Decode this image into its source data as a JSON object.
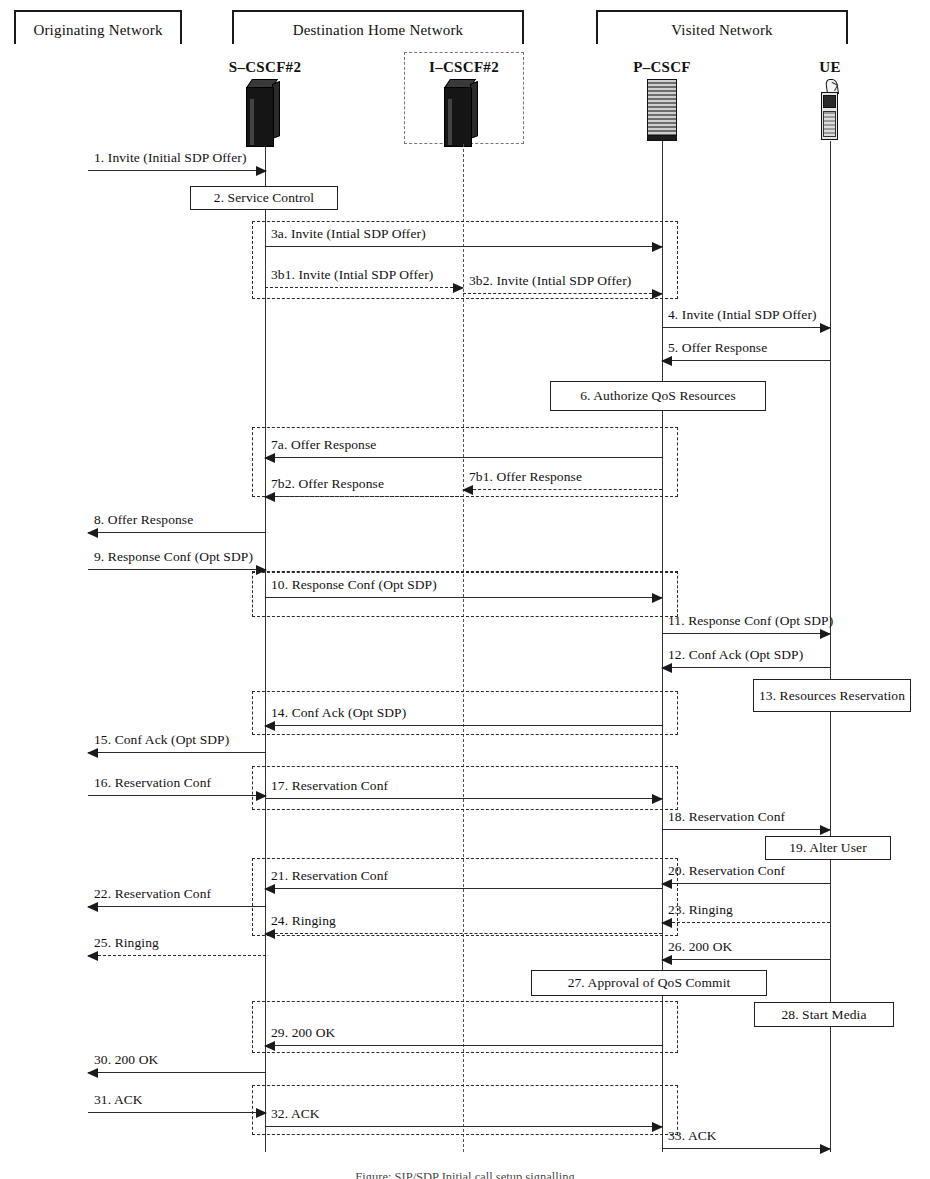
{
  "diagram": {
    "caption": "Figure: SIP/SDP Initial call setup signalling",
    "networks": [
      {
        "id": "originating",
        "label": "Originating Network"
      },
      {
        "id": "destination-home",
        "label": "Destination Home Network"
      },
      {
        "id": "visited",
        "label": "Visited Network"
      }
    ],
    "actors": [
      {
        "id": "s-cscf2",
        "label": "S–CSCF#2",
        "icon": "server-tower-icon",
        "optional": false
      },
      {
        "id": "i-cscf2",
        "label": "I–CSCF#2",
        "icon": "server-tower-icon",
        "optional": true
      },
      {
        "id": "p-cscf",
        "label": "P–CSCF",
        "icon": "server-rack-icon",
        "optional": false
      },
      {
        "id": "ue",
        "label": "UE",
        "icon": "mobile-phone-icon",
        "optional": false
      }
    ],
    "messages": [
      {
        "n": "1",
        "label": "1. Invite (Initial SDP Offer)",
        "from": "originating",
        "to": "s-cscf2",
        "dir": "right",
        "style": "solid"
      },
      {
        "n": "3a",
        "label": "3a. Invite (Intial SDP Offer)",
        "from": "s-cscf2",
        "to": "p-cscf",
        "dir": "right",
        "style": "solid"
      },
      {
        "n": "3b1",
        "label": "3b1. Invite (Intial SDP Offer)",
        "from": "s-cscf2",
        "to": "i-cscf2",
        "dir": "right",
        "style": "dashed"
      },
      {
        "n": "3b2",
        "label": "3b2. Invite (Intial SDP Offer)",
        "from": "i-cscf2",
        "to": "p-cscf",
        "dir": "right",
        "style": "dashed"
      },
      {
        "n": "4",
        "label": "4. Invite (Intial SDP Offer)",
        "from": "p-cscf",
        "to": "ue",
        "dir": "right",
        "style": "solid"
      },
      {
        "n": "5",
        "label": "5. Offer Response",
        "from": "ue",
        "to": "p-cscf",
        "dir": "left",
        "style": "solid"
      },
      {
        "n": "7a",
        "label": "7a. Offer Response",
        "from": "p-cscf",
        "to": "s-cscf2",
        "dir": "left",
        "style": "solid"
      },
      {
        "n": "7b1",
        "label": "7b1. Offer Response",
        "from": "p-cscf",
        "to": "i-cscf2",
        "dir": "left",
        "style": "dashed"
      },
      {
        "n": "7b2",
        "label": "7b2. Offer Response",
        "from": "i-cscf2",
        "to": "s-cscf2",
        "dir": "left",
        "style": "dashed"
      },
      {
        "n": "8",
        "label": "8. Offer Response",
        "from": "s-cscf2",
        "to": "originating",
        "dir": "left",
        "style": "solid"
      },
      {
        "n": "9",
        "label": "9. Response Conf (Opt SDP)",
        "from": "originating",
        "to": "s-cscf2",
        "dir": "right",
        "style": "solid"
      },
      {
        "n": "10",
        "label": "10. Response Conf (Opt SDP)",
        "from": "s-cscf2",
        "to": "p-cscf",
        "dir": "right",
        "style": "solid"
      },
      {
        "n": "11",
        "label": "11. Response Conf (Opt SDP)",
        "from": "p-cscf",
        "to": "ue",
        "dir": "right",
        "style": "solid"
      },
      {
        "n": "12",
        "label": "12. Conf Ack (Opt SDP)",
        "from": "ue",
        "to": "p-cscf",
        "dir": "left",
        "style": "solid"
      },
      {
        "n": "14",
        "label": "14. Conf Ack (Opt SDP)",
        "from": "p-cscf",
        "to": "s-cscf2",
        "dir": "left",
        "style": "solid"
      },
      {
        "n": "15",
        "label": "15. Conf Ack (Opt SDP)",
        "from": "s-cscf2",
        "to": "originating",
        "dir": "left",
        "style": "solid"
      },
      {
        "n": "16",
        "label": "16. Reservation Conf",
        "from": "originating",
        "to": "s-cscf2",
        "dir": "right",
        "style": "solid"
      },
      {
        "n": "17",
        "label": "17. Reservation Conf",
        "from": "s-cscf2",
        "to": "p-cscf",
        "dir": "right",
        "style": "solid"
      },
      {
        "n": "18",
        "label": "18. Reservation Conf",
        "from": "p-cscf",
        "to": "ue",
        "dir": "right",
        "style": "solid"
      },
      {
        "n": "20",
        "label": "20. Reservation Conf",
        "from": "ue",
        "to": "p-cscf",
        "dir": "left",
        "style": "solid"
      },
      {
        "n": "21",
        "label": "21. Reservation Conf",
        "from": "p-cscf",
        "to": "s-cscf2",
        "dir": "left",
        "style": "solid"
      },
      {
        "n": "22",
        "label": "22. Reservation Conf",
        "from": "s-cscf2",
        "to": "originating",
        "dir": "left",
        "style": "solid"
      },
      {
        "n": "23",
        "label": "23. Ringing",
        "from": "ue",
        "to": "p-cscf",
        "dir": "left",
        "style": "dashed"
      },
      {
        "n": "24",
        "label": "24. Ringing",
        "from": "p-cscf",
        "to": "s-cscf2",
        "dir": "left",
        "style": "dashed"
      },
      {
        "n": "25",
        "label": "25. Ringing",
        "from": "s-cscf2",
        "to": "originating",
        "dir": "left",
        "style": "dashed"
      },
      {
        "n": "26",
        "label": "26. 200 OK",
        "from": "ue",
        "to": "p-cscf",
        "dir": "left",
        "style": "solid"
      },
      {
        "n": "29",
        "label": "29. 200 OK",
        "from": "p-cscf",
        "to": "s-cscf2",
        "dir": "left",
        "style": "solid"
      },
      {
        "n": "30",
        "label": "30. 200 OK",
        "from": "s-cscf2",
        "to": "originating",
        "dir": "left",
        "style": "solid"
      },
      {
        "n": "31",
        "label": "31. ACK",
        "from": "originating",
        "to": "s-cscf2",
        "dir": "right",
        "style": "solid"
      },
      {
        "n": "32",
        "label": "32. ACK",
        "from": "s-cscf2",
        "to": "p-cscf",
        "dir": "right",
        "style": "solid"
      },
      {
        "n": "33",
        "label": "33. ACK",
        "from": "p-cscf",
        "to": "ue",
        "dir": "right",
        "style": "solid"
      }
    ],
    "process_boxes": [
      {
        "n": "2",
        "label": "2. Service Control",
        "on": "s-cscf2"
      },
      {
        "n": "6",
        "label": "6. Authorize QoS Resources",
        "on": "p-cscf"
      },
      {
        "n": "13",
        "label": "13. Resources Reservation",
        "on": "ue"
      },
      {
        "n": "19",
        "label": "19. Alter User",
        "on": "ue"
      },
      {
        "n": "27",
        "label": "27. Approval of QoS Commit",
        "on": "p-cscf"
      },
      {
        "n": "28",
        "label": "28. Start Media",
        "on": "ue"
      }
    ],
    "colors": {
      "line": "#2a2a2a",
      "lifeline": "#333333",
      "box_border": "#1f1f1f",
      "background": "#ffffff"
    }
  }
}
